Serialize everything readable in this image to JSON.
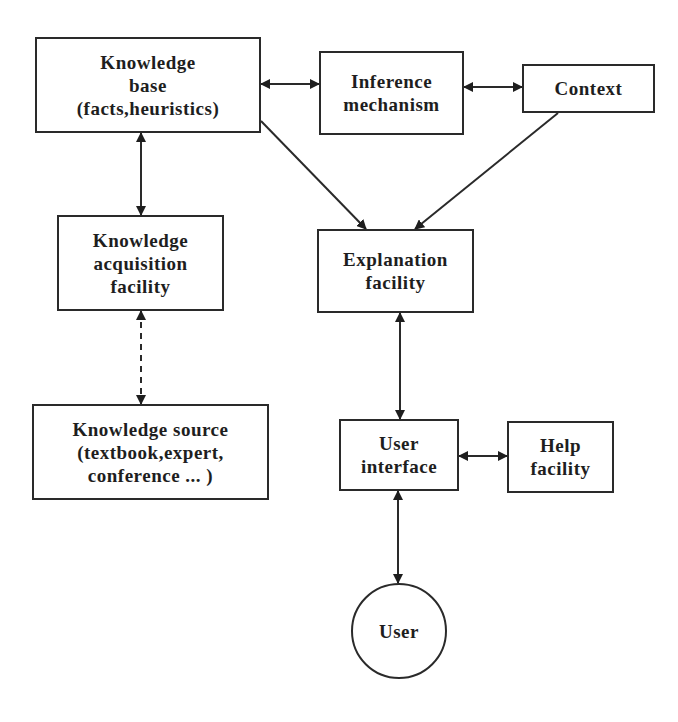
{
  "diagram": {
    "title": "",
    "nodes": [
      {
        "id": "knowledge-base",
        "shape": "rect",
        "lines": [
          "Knowledge",
          "base",
          "(facts,heuristics)"
        ],
        "x": 35,
        "y": 37,
        "w": 226,
        "h": 96
      },
      {
        "id": "inference-mechanism",
        "shape": "rect",
        "lines": [
          "Inference",
          "mechanism"
        ],
        "x": 319,
        "y": 51,
        "w": 145,
        "h": 84
      },
      {
        "id": "context",
        "shape": "rect",
        "lines": [
          "Context"
        ],
        "x": 522,
        "y": 64,
        "w": 133,
        "h": 49
      },
      {
        "id": "knowledge-acquisition-facility",
        "shape": "rect",
        "lines": [
          "Knowledge",
          "acquisition",
          "facility"
        ],
        "x": 57,
        "y": 215,
        "w": 167,
        "h": 96
      },
      {
        "id": "explanation-facility",
        "shape": "rect",
        "lines": [
          "Explanation",
          "facility"
        ],
        "x": 317,
        "y": 229,
        "w": 157,
        "h": 84
      },
      {
        "id": "knowledge-source",
        "shape": "rect",
        "lines": [
          "Knowledge  source",
          "(textbook,expert,",
          "conference  ...  )"
        ],
        "x": 32,
        "y": 404,
        "w": 237,
        "h": 96
      },
      {
        "id": "user-interface",
        "shape": "rect",
        "lines": [
          "User",
          "interface"
        ],
        "x": 339,
        "y": 419,
        "w": 120,
        "h": 72
      },
      {
        "id": "help-facility",
        "shape": "rect",
        "lines": [
          "Help",
          "facility"
        ],
        "x": 507,
        "y": 421,
        "w": 107,
        "h": 72
      },
      {
        "id": "user",
        "shape": "circle",
        "lines": [
          "User"
        ],
        "x": 351,
        "y": 583,
        "w": 96,
        "h": 96
      }
    ],
    "edges": [
      {
        "from": "knowledge-base",
        "to": "inference-mechanism",
        "style": "solid",
        "arrows": "both",
        "x1": 261,
        "y1": 84,
        "x2": 319,
        "y2": 84
      },
      {
        "from": "inference-mechanism",
        "to": "context",
        "style": "solid",
        "arrows": "both",
        "x1": 464,
        "y1": 87,
        "x2": 522,
        "y2": 87
      },
      {
        "from": "knowledge-base",
        "to": "knowledge-acquisition-facility",
        "style": "solid",
        "arrows": "both",
        "x1": 141,
        "y1": 133,
        "x2": 141,
        "y2": 215
      },
      {
        "from": "knowledge-base",
        "to": "explanation-facility",
        "style": "solid",
        "arrows": "end",
        "x1": 261,
        "y1": 121,
        "x2": 366,
        "y2": 229
      },
      {
        "from": "context",
        "to": "explanation-facility",
        "style": "solid",
        "arrows": "end",
        "x1": 558,
        "y1": 113,
        "x2": 415,
        "y2": 229
      },
      {
        "from": "knowledge-acquisition-facility",
        "to": "knowledge-source",
        "style": "dashed",
        "arrows": "both",
        "x1": 141,
        "y1": 311,
        "x2": 141,
        "y2": 404
      },
      {
        "from": "explanation-facility",
        "to": "user-interface",
        "style": "solid",
        "arrows": "both",
        "x1": 400,
        "y1": 313,
        "x2": 400,
        "y2": 419
      },
      {
        "from": "user-interface",
        "to": "help-facility",
        "style": "solid",
        "arrows": "both",
        "x1": 459,
        "y1": 456,
        "x2": 507,
        "y2": 456
      },
      {
        "from": "user-interface",
        "to": "user",
        "style": "solid",
        "arrows": "both",
        "x1": 398,
        "y1": 491,
        "x2": 398,
        "y2": 583
      }
    ],
    "colors": {
      "stroke": "#2a2a2a",
      "text": "#1e1e1e",
      "background": "#ffffff"
    }
  }
}
